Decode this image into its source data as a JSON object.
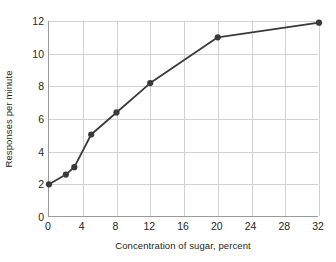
{
  "chart_data": {
    "type": "line",
    "title": "",
    "xlabel": "Concentration of sugar, percent",
    "ylabel": "Responses per minute",
    "xlim": [
      0,
      32
    ],
    "ylim": [
      0,
      12
    ],
    "xticks": [
      "0",
      "4",
      "8",
      "12",
      "16",
      "20",
      "24",
      "28",
      "32"
    ],
    "xtick_values": [
      0,
      4,
      8,
      12,
      16,
      20,
      24,
      28,
      32
    ],
    "yticks": [
      "0",
      "2",
      "4",
      "6",
      "8",
      "10",
      "12"
    ],
    "ytick_values": [
      0,
      2,
      4,
      6,
      8,
      10,
      12
    ],
    "grid": true,
    "legend": "none",
    "series": [
      {
        "name": "Responses per minute",
        "marker": "circle",
        "color": "#3a3a3a",
        "x": [
          0,
          2,
          3,
          5,
          8,
          12,
          20,
          32
        ],
        "y": [
          2.0,
          2.6,
          3.05,
          5.05,
          6.4,
          8.2,
          11.0,
          11.9
        ]
      }
    ]
  },
  "colors": {
    "background": "#ffffff",
    "grid": "#d2d2d2",
    "axis": "#9a9a9a",
    "series": "#3a3a3a",
    "text": "#231f20"
  }
}
